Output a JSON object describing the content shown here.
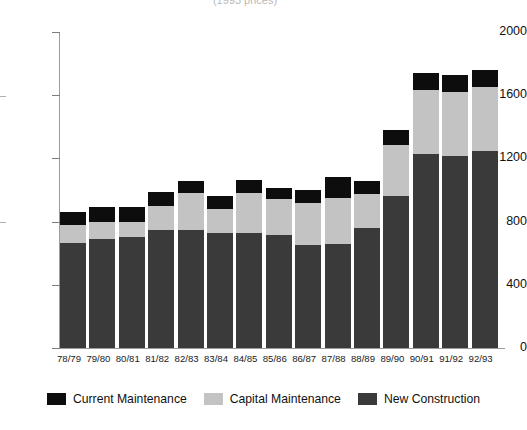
{
  "title_strip": "(1993 prices)",
  "chart_data": {
    "type": "bar",
    "title": "",
    "subtitle": "(1993 prices)",
    "xlabel": "",
    "ylabel": "",
    "ylim": [
      0,
      2000
    ],
    "yticks": [
      0,
      400,
      800,
      1200,
      1600,
      2000
    ],
    "ytick_labels": [
      "0",
      "400",
      "800",
      "1200",
      "1600",
      "2000"
    ],
    "grid": false,
    "stacked": true,
    "legend_position": "bottom",
    "categories": [
      "78/79",
      "79/80",
      "80/81",
      "81/82",
      "82/83",
      "83/84",
      "84/85",
      "85/86",
      "86/87",
      "87/88",
      "88/89",
      "89/90",
      "90/91",
      "91/92",
      "92/93"
    ],
    "series": [
      {
        "name": "New Construction",
        "color": "#3a3a3a",
        "values": [
          665,
          690,
          700,
          745,
          750,
          730,
          725,
          715,
          650,
          660,
          760,
          965,
          1230,
          1215,
          1250
        ]
      },
      {
        "name": "Capital Maintenance",
        "color": "#c3c3c3",
        "values": [
          115,
          110,
          100,
          155,
          230,
          150,
          255,
          225,
          265,
          290,
          215,
          320,
          400,
          405,
          400
        ]
      },
      {
        "name": "Current Maintenance",
        "color": "#0d0d0d",
        "values": [
          80,
          95,
          90,
          85,
          80,
          85,
          85,
          75,
          85,
          135,
          80,
          95,
          110,
          105,
          110
        ]
      }
    ],
    "totals": [
      860,
      895,
      890,
      985,
      1060,
      965,
      1065,
      1015,
      1000,
      1085,
      1055,
      1380,
      1740,
      1725,
      1760
    ]
  },
  "legend": {
    "items": [
      {
        "label": "Current Maintenance",
        "swatch": "black-swatch"
      },
      {
        "label": "Capital Maintenance",
        "swatch": "light-gray-swatch"
      },
      {
        "label": "New Construction",
        "swatch": "dark-gray-swatch"
      }
    ]
  }
}
